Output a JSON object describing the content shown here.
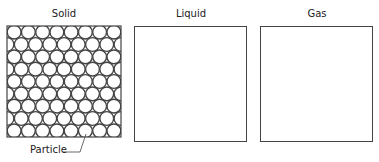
{
  "panels": [
    {
      "id": "solid",
      "title": "Solid"
    },
    {
      "id": "liquid",
      "title": "Liquid"
    },
    {
      "id": "gas",
      "title": "Gas"
    }
  ],
  "annotations": {
    "particle_label": "Particle"
  },
  "solid_grid": {
    "rows": 9,
    "circles_per_row": 8,
    "arrangement": "hexagonal close-packed"
  },
  "colors": {
    "stroke": "#444444",
    "background": "#ffffff"
  }
}
